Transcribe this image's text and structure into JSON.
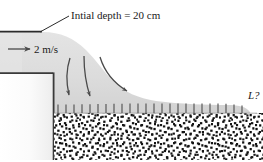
{
  "figure": {
    "background_color": "#ffffff",
    "width": 263,
    "height": 162
  },
  "labels": {
    "initial_depth": "Intial depth = 20 cm",
    "velocity": "2 m/s",
    "length_unknown": "L?"
  },
  "colors": {
    "water_fill": "#d9d9d9",
    "water_fill_light": "#e2e2e2",
    "outline": "#2b2b2b",
    "wall": "#3a3a3a",
    "arrow": "#4a4a4a",
    "ground_speckle": "#111111",
    "ground_base": "#ffffff",
    "text": "#1a1a1a"
  },
  "geometry": {
    "upstream_surface_y": 32,
    "upstream_channel_left": 0,
    "upstream_channel_right": 43,
    "wall_x": 53,
    "wall_top_y": 73,
    "wall_bottom_y": 160,
    "ground_surface_y": 113,
    "ground_bottom_y": 160,
    "ground_left_x": 54,
    "ground_right_x": 263,
    "shear_tick_top_y": 104,
    "shear_tick_count": 24,
    "shear_tick_start_x": 57,
    "shear_tick_end_x": 248
  },
  "annotations": {
    "leader_line": {
      "name": "initial-depth-leader",
      "from_x": 40,
      "from_y": 32,
      "to_x": 69,
      "to_y": 16
    },
    "velocity_arrow": {
      "name": "velocity-arrow",
      "from_x": 8,
      "from_y": 49,
      "to_x": 31,
      "to_y": 49,
      "direction": "right"
    },
    "flow_streamlines": [
      {
        "name": "streamline-1",
        "label": "inner"
      },
      {
        "name": "streamline-2",
        "label": "middle"
      },
      {
        "name": "streamline-3",
        "label": "outer"
      }
    ]
  }
}
